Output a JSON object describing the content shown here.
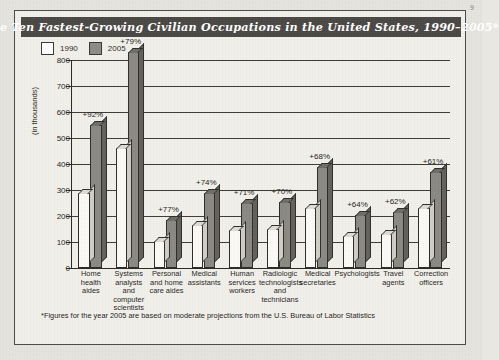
{
  "page": {
    "corner_mark": "9"
  },
  "title": "The Ten Fastest-Growing Civilian Occupations in the United States, 1990–2005*",
  "legend": {
    "items": [
      {
        "label": "1990",
        "swatch": "white-square",
        "color": "#ffffff"
      },
      {
        "label": "2005",
        "swatch": "gray-square",
        "color": "#8e8c86"
      }
    ]
  },
  "footnote": "*Figures for the year 2005 are based on moderate projections from the U.S. Bureau of Labor Statistics",
  "colors": {
    "title_bar": "#4a4845",
    "title_text": "#ffffff",
    "card_bg": "#f2f0ea",
    "page_bg": "#e6e4de",
    "bar_1990": "#fbfaf6",
    "bar_2005": "#8b8983",
    "axis": "#2a2824"
  },
  "chart_data": {
    "type": "bar",
    "title": "The Ten Fastest-Growing Civilian Occupations in the United States, 1990–2005*",
    "xlabel": "",
    "ylabel": "(in thousands)",
    "ylim": [
      0,
      800
    ],
    "yticks": [
      0,
      100,
      200,
      300,
      400,
      500,
      600,
      700,
      800
    ],
    "ytick_labels": [
      "0",
      "100",
      "200",
      "300",
      "400",
      "500",
      "600",
      "700",
      "800"
    ],
    "grid": true,
    "legend_position": "top-left",
    "categories": [
      "Home health aides",
      "Systems analysts and computer scientists",
      "Personal and home care aides",
      "Medical assistants",
      "Human services workers",
      "Radiologic technologists and technicians",
      "Medical secretaries",
      "Psychologists",
      "Travel agents",
      "Correction officers"
    ],
    "category_lines": [
      [
        "Home",
        "health",
        "aides"
      ],
      [
        "Systems",
        "analysts",
        "and",
        "computer",
        "scientists"
      ],
      [
        "Personal",
        "and home",
        "care aides"
      ],
      [
        "Medical",
        "assistants"
      ],
      [
        "Human",
        "services",
        "workers"
      ],
      [
        "Radiologic",
        "technologists",
        "and",
        "technicians"
      ],
      [
        "Medical",
        "secretaries"
      ],
      [
        "Psychologists"
      ],
      [
        "Travel",
        "agents"
      ],
      [
        "Correction",
        "officers"
      ]
    ],
    "series": [
      {
        "name": "1990",
        "values": [
          287,
          463,
          103,
          165,
          145,
          149,
          232,
          125,
          132,
          230
        ]
      },
      {
        "name": "2005",
        "values": [
          550,
          829,
          183,
          287,
          249,
          253,
          390,
          204,
          214,
          370
        ]
      }
    ],
    "annotations": [
      "+92%",
      "+79%",
      "+77%",
      "+74%",
      "+71%",
      "+70%",
      "+68%",
      "+64%",
      "+62%",
      "+61%"
    ]
  }
}
